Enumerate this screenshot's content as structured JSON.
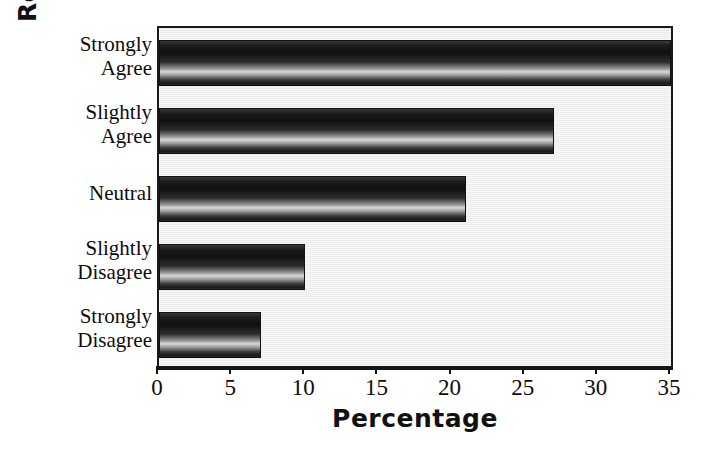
{
  "chart_data": {
    "type": "bar",
    "orientation": "horizontal",
    "title": "",
    "xlabel": "Percentage",
    "ylabel": "Response Categories",
    "categories": [
      "Strongly Agree",
      "Slightly Agree",
      "Neutral",
      "Slightly Disagree",
      "Strongly Disagree"
    ],
    "category_lines": [
      [
        "Strongly",
        "Agree"
      ],
      [
        "Slightly",
        "Agree"
      ],
      [
        "Neutral",
        ""
      ],
      [
        "Slightly",
        "Disagree"
      ],
      [
        "Strongly",
        "Disagree"
      ]
    ],
    "values": [
      35,
      27,
      21,
      10,
      7
    ],
    "xlim": [
      0,
      35
    ],
    "xticks": [
      0,
      5,
      10,
      15,
      20,
      25,
      30,
      35
    ],
    "xtick_labels": [
      "0",
      "5",
      "10",
      "15",
      "20",
      "25",
      "30",
      "35"
    ],
    "grid": false,
    "legend": false,
    "bar_style": "3d-cylinder-gradient-grayscale",
    "plot_background_color": "#e7e7e7",
    "bar_color_dark": "#101010",
    "bar_color_light": "#d8d8d8",
    "axis_color": "#141414",
    "text_color": "#0d0d0d"
  }
}
